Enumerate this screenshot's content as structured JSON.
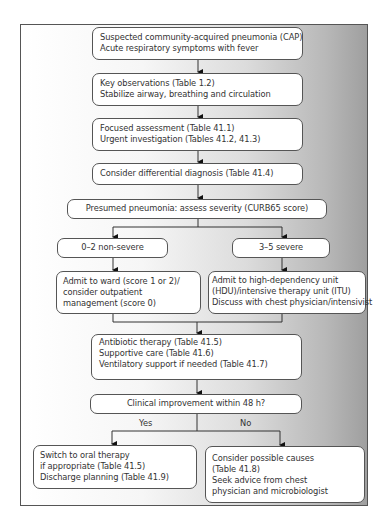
{
  "diagram": {
    "nodes": [
      {
        "id": "start",
        "lines": [
          "Suspected community-acquired pneumonia (CAP)",
          "Acute respiratory symptoms with fever"
        ]
      },
      {
        "id": "observations",
        "lines": [
          "Key observations (Table 1.2)",
          "Stabilize airway, breathing and circulation"
        ]
      },
      {
        "id": "assessment",
        "lines": [
          "Focused assessment (Table 41.1)",
          "Urgent investigation (Tables 41.2, 41.3)"
        ]
      },
      {
        "id": "differential",
        "lines": [
          "Consider differential diagnosis (Table 41.4)"
        ]
      },
      {
        "id": "severity",
        "lines": [
          "Presumed pneumonia: assess severity (CURB65 score)"
        ]
      },
      {
        "id": "non-severe",
        "lines": [
          "0–2 non-severe"
        ]
      },
      {
        "id": "severe",
        "lines": [
          "3–5 severe"
        ]
      },
      {
        "id": "ward",
        "lines": [
          "Admit to ward (score 1 or 2)/",
          "consider outpatient",
          "management (score 0)"
        ]
      },
      {
        "id": "hdu",
        "lines": [
          "Admit to high-dependency unit",
          "(HDU)/intensive therapy unit (ITU)",
          "Discuss with chest physician/intensivist"
        ]
      },
      {
        "id": "therapy",
        "lines": [
          "Antibiotic therapy (Table 41.5)",
          "Supportive care (Table 41.6)",
          "Ventilatory support if needed (Table 41.7)"
        ]
      },
      {
        "id": "improvement",
        "lines": [
          "Clinical improvement within 48 h?"
        ]
      },
      {
        "id": "oral",
        "lines": [
          "Switch to oral therapy",
          "if appropriate (Table 41.5)",
          "Discharge planning (Table 41.9)"
        ]
      },
      {
        "id": "causes",
        "lines": [
          "Consider possible causes",
          "(Table 41.8)",
          "Seek advice from chest",
          "physician and microbiologist"
        ]
      }
    ],
    "edge_labels": {
      "yes": "Yes",
      "no": "No"
    },
    "colors": {
      "border": "#555555",
      "box_fill": "#ffffff",
      "text": "#333333",
      "gradient_dark": "#9f9f9f"
    }
  }
}
